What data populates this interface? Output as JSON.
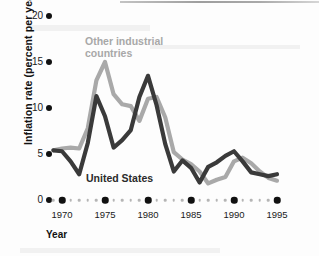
{
  "chart_data": {
    "type": "line",
    "title": "",
    "xlabel": "Year",
    "ylabel": "Inflation rate (percent per year)",
    "xlim": [
      1969,
      1995
    ],
    "ylim": [
      0,
      20
    ],
    "yticks": [
      0,
      5,
      10,
      15,
      20
    ],
    "xticks": [
      1970,
      1975,
      1980,
      1985,
      1990,
      1995
    ],
    "xtick_labels": [
      "1970",
      "1975",
      "1980",
      "1985",
      "1990",
      "1995"
    ],
    "ytick_labels": [
      "0",
      "5",
      "10",
      "15",
      "20"
    ],
    "grid": false,
    "legend": "inline-annotations",
    "x": [
      1969,
      1970,
      1971,
      1972,
      1973,
      1974,
      1975,
      1976,
      1977,
      1978,
      1979,
      1980,
      1981,
      1982,
      1983,
      1984,
      1985,
      1986,
      1987,
      1988,
      1989,
      1990,
      1991,
      1992,
      1993,
      1994,
      1995
    ],
    "series": [
      {
        "name": "United States",
        "color": "#3a3a3a",
        "values": [
          5.4,
          5.3,
          4.2,
          2.8,
          6.2,
          11.3,
          9.1,
          5.7,
          6.5,
          7.6,
          11.2,
          13.5,
          10.3,
          6.1,
          3.1,
          4.3,
          3.5,
          1.9,
          3.6,
          4.1,
          4.8,
          5.3,
          4.2,
          3.0,
          2.8,
          2.6,
          2.8
        ],
        "annotation": "United States"
      },
      {
        "name": "Other industrial countries",
        "color": "#a9a9a9",
        "values": [
          5.4,
          5.6,
          5.7,
          5.6,
          7.8,
          13.0,
          15.0,
          11.5,
          10.4,
          10.2,
          8.6,
          11.0,
          11.2,
          9.0,
          5.2,
          4.4,
          3.9,
          3.1,
          1.8,
          2.2,
          2.5,
          4.2,
          4.6,
          4.0,
          3.1,
          2.4,
          2.1
        ],
        "annotation": "Other industrial countries"
      }
    ]
  },
  "axis": {
    "y_title": "Inflation rate (percent per year)",
    "x_title": "Year"
  },
  "labels": {
    "other_industrial": "Other industrial\ncountries",
    "united_states": "United States"
  },
  "colors": {
    "us_line": "#3a3a3a",
    "other_line": "#a9a9a9",
    "axis_dot": "#111111",
    "minor_dot": "#b5b5b5",
    "background": "#fdfdfd"
  }
}
